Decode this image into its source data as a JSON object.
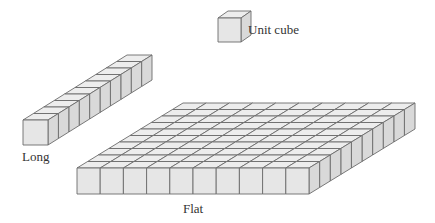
{
  "diagram": {
    "colors": {
      "face": "#e6e6e6",
      "top": "#ededed",
      "side": "#d9d9d9",
      "stroke": "#6b6b6b"
    },
    "blocks": [
      {
        "id": "unit",
        "label": "Unit cube",
        "cubes": 1
      },
      {
        "id": "long",
        "label": "Long",
        "cubes": 10
      },
      {
        "id": "flat",
        "label": "Flat",
        "cubes": 100
      }
    ]
  }
}
